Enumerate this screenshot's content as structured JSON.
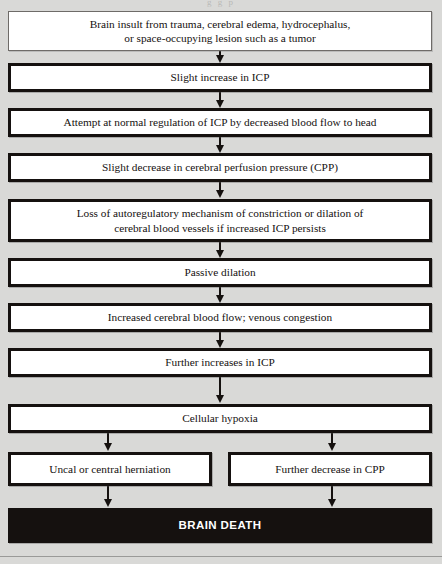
{
  "figure": {
    "background_color": "#d9d9d7",
    "ink_color": "#15110f",
    "top_fragment": "g   g   p"
  },
  "chart_data": {
    "type": "diagram",
    "diagram_kind": "flowchart",
    "orientation": "top-to-bottom",
    "nodes": [
      {
        "id": "n1",
        "label": "Brain insult from trauma, cerebral edema, hydrocephalus, or space-occupying lesion such as a tumor",
        "lines": [
          "Brain insult from trauma, cerebral edema, hydrocephalus,",
          "or space-occupying lesion such as a tumor"
        ],
        "style": "thin",
        "x": 8,
        "y": 11,
        "w": 424,
        "h": 40
      },
      {
        "id": "n2",
        "label": "Slight increase in ICP",
        "lines": [
          "Slight increase in ICP"
        ],
        "style": "heavy",
        "x": 8,
        "y": 63,
        "w": 424,
        "h": 29
      },
      {
        "id": "n3",
        "label": "Attempt at normal regulation of ICP by decreased blood flow to head",
        "lines": [
          "Attempt at normal regulation of ICP by decreased blood flow to head"
        ],
        "style": "heavy",
        "x": 8,
        "y": 108,
        "w": 424,
        "h": 29
      },
      {
        "id": "n4",
        "label": "Slight decrease in cerebral perfusion pressure (CPP)",
        "lines": [
          "Slight decrease in cerebral perfusion pressure (CPP)"
        ],
        "style": "heavy",
        "x": 8,
        "y": 153,
        "w": 424,
        "h": 29
      },
      {
        "id": "n5",
        "label": "Loss of autoregulatory mechanism of constriction or dilation of cerebral blood vessels if increased ICP persists",
        "lines": [
          "Loss of autoregulatory mechanism of constriction or dilation of",
          "cerebral blood vessels if increased ICP persists"
        ],
        "style": "heavy",
        "x": 8,
        "y": 199,
        "w": 424,
        "h": 43
      },
      {
        "id": "n6",
        "label": "Passive dilation",
        "lines": [
          "Passive dilation"
        ],
        "style": "heavy",
        "x": 8,
        "y": 258,
        "w": 424,
        "h": 29
      },
      {
        "id": "n7",
        "label": "Increased cerebral blood flow; venous congestion",
        "lines": [
          "Increased cerebral blood flow; venous congestion"
        ],
        "style": "heavy",
        "x": 8,
        "y": 303,
        "w": 424,
        "h": 29
      },
      {
        "id": "n8",
        "label": "Further increases in ICP",
        "lines": [
          "Further increases in ICP"
        ],
        "style": "heavy",
        "x": 8,
        "y": 348,
        "w": 424,
        "h": 29
      },
      {
        "id": "n9",
        "label": "Cellular hypoxia",
        "lines": [
          "Cellular hypoxia"
        ],
        "style": "heavy",
        "x": 8,
        "y": 404,
        "w": 424,
        "h": 29
      },
      {
        "id": "n10",
        "label": "Uncal or central herniation",
        "lines": [
          "Uncal or central herniation"
        ],
        "style": "heavy",
        "x": 8,
        "y": 452,
        "w": 204,
        "h": 34
      },
      {
        "id": "n11",
        "label": "Further decrease in CPP",
        "lines": [
          "Further decrease in CPP"
        ],
        "style": "heavy",
        "x": 228,
        "y": 452,
        "w": 204,
        "h": 34
      },
      {
        "id": "n12",
        "label": "BRAIN DEATH",
        "lines": [
          "BRAIN DEATH"
        ],
        "style": "terminal",
        "x": 8,
        "y": 508,
        "w": 424,
        "h": 35
      }
    ],
    "edges": [
      {
        "from": "n1",
        "to": "n2",
        "x": 220,
        "y": 51,
        "len": 5
      },
      {
        "from": "n2",
        "to": "n3",
        "x": 220,
        "y": 92,
        "len": 9
      },
      {
        "from": "n3",
        "to": "n4",
        "x": 220,
        "y": 137,
        "len": 9
      },
      {
        "from": "n4",
        "to": "n5",
        "x": 220,
        "y": 182,
        "len": 9
      },
      {
        "from": "n5",
        "to": "n6",
        "x": 220,
        "y": 242,
        "len": 9
      },
      {
        "from": "n6",
        "to": "n7",
        "x": 220,
        "y": 287,
        "len": 9
      },
      {
        "from": "n7",
        "to": "n8",
        "x": 220,
        "y": 332,
        "len": 9
      },
      {
        "from": "n8",
        "to": "n9",
        "x": 220,
        "y": 377,
        "len": 19
      },
      {
        "from": "n9",
        "to": "n10",
        "x": 108,
        "y": 433,
        "len": 11
      },
      {
        "from": "n9",
        "to": "n11",
        "x": 332,
        "y": 433,
        "len": 11
      },
      {
        "from": "n10",
        "to": "n12",
        "x": 108,
        "y": 486,
        "len": 14
      },
      {
        "from": "n11",
        "to": "n12",
        "x": 332,
        "y": 486,
        "len": 14
      }
    ],
    "page_rule_y": 556
  }
}
